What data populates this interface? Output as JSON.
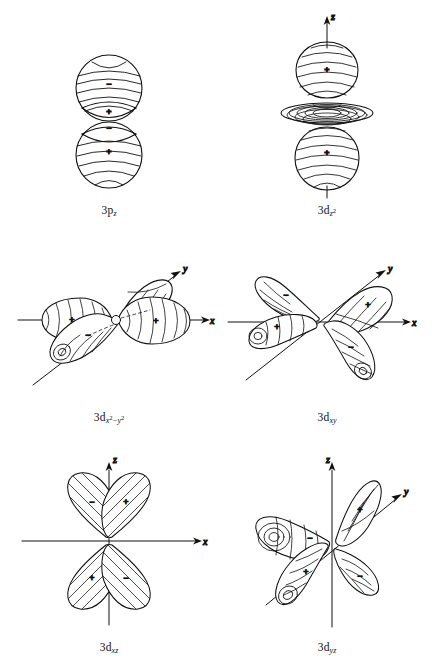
{
  "figure": {
    "background_color": "#ffffff",
    "ink_color": "#111111",
    "title": "",
    "columns": 2,
    "rows": 3
  },
  "panels": [
    {
      "id": "3pz",
      "label_base": "3p",
      "label_sub": "z",
      "label_sub_sup": "",
      "label_plain": "3pz",
      "style": "banded-sphere-pair",
      "axes": [],
      "lobes": [
        {
          "sign": "-",
          "position": "upper-main"
        },
        {
          "sign": "+",
          "position": "upper-cap"
        },
        {
          "sign": "-",
          "position": "lower-cap"
        },
        {
          "sign": "+",
          "position": "lower-main"
        }
      ]
    },
    {
      "id": "3dz2",
      "label_base": "3d",
      "label_sub": "z",
      "label_sub_sup": "2",
      "label_plain": "3dz2",
      "style": "dumbbell-with-torus",
      "axes": [
        {
          "name": "z",
          "label": "z",
          "direction": "up"
        }
      ],
      "lobes": [
        {
          "sign": "+",
          "position": "top"
        },
        {
          "sign": "+",
          "position": "bottom"
        }
      ]
    },
    {
      "id": "3dx2-y2",
      "label_base": "3d",
      "label_sub": "x",
      "label_sub_sup": "2",
      "label_tail_minus": "−",
      "label_tail_base": "y",
      "label_tail_sup": "2",
      "label_plain": "3dx2-y2",
      "style": "four-teardrops-perspective-axial",
      "axes": [
        {
          "name": "y",
          "label": "y",
          "direction": "up-right"
        },
        {
          "name": "x",
          "label": "x",
          "direction": "right"
        }
      ],
      "lobes": [
        {
          "sign": "+",
          "position": "left"
        },
        {
          "sign": "+",
          "position": "right"
        },
        {
          "sign": "-",
          "position": "back-right"
        },
        {
          "sign": "-",
          "position": "front-left"
        }
      ]
    },
    {
      "id": "3dxy",
      "label_base": "3d",
      "label_sub": "xy",
      "label_sub_sup": "",
      "label_plain": "3dxy",
      "style": "four-teardrops-perspective-diagonal",
      "axes": [
        {
          "name": "y",
          "label": "y",
          "direction": "up-right"
        },
        {
          "name": "x",
          "label": "x",
          "direction": "right"
        }
      ],
      "lobes": [
        {
          "sign": "-",
          "position": "upper-left"
        },
        {
          "sign": "+",
          "position": "upper-right"
        },
        {
          "sign": "+",
          "position": "lower-left"
        },
        {
          "sign": "-",
          "position": "lower-right"
        }
      ]
    },
    {
      "id": "3dxz",
      "label_base": "3d",
      "label_sub": "xz",
      "label_sub_sup": "",
      "label_plain": "3dxz",
      "style": "four-lobe-cloverleaf-hatched",
      "axes": [
        {
          "name": "z",
          "label": "z",
          "direction": "up"
        },
        {
          "name": "x",
          "label": "x",
          "direction": "right"
        }
      ],
      "lobes": [
        {
          "sign": "-",
          "position": "upper-left"
        },
        {
          "sign": "+",
          "position": "upper-right"
        },
        {
          "sign": "+",
          "position": "lower-left"
        },
        {
          "sign": "-",
          "position": "lower-right"
        }
      ]
    },
    {
      "id": "3dyz",
      "label_base": "3d",
      "label_sub": "yz",
      "label_sub_sup": "",
      "label_plain": "3dyz",
      "style": "four-teardrops-perspective-yz",
      "axes": [
        {
          "name": "z",
          "label": "z",
          "direction": "up"
        },
        {
          "name": "y",
          "label": "y",
          "direction": "up-right"
        }
      ],
      "lobes": [
        {
          "sign": "-",
          "position": "upper-left"
        },
        {
          "sign": "+",
          "position": "upper-right"
        },
        {
          "sign": "+",
          "position": "lower-left"
        },
        {
          "sign": "-",
          "position": "lower-right"
        }
      ]
    }
  ]
}
